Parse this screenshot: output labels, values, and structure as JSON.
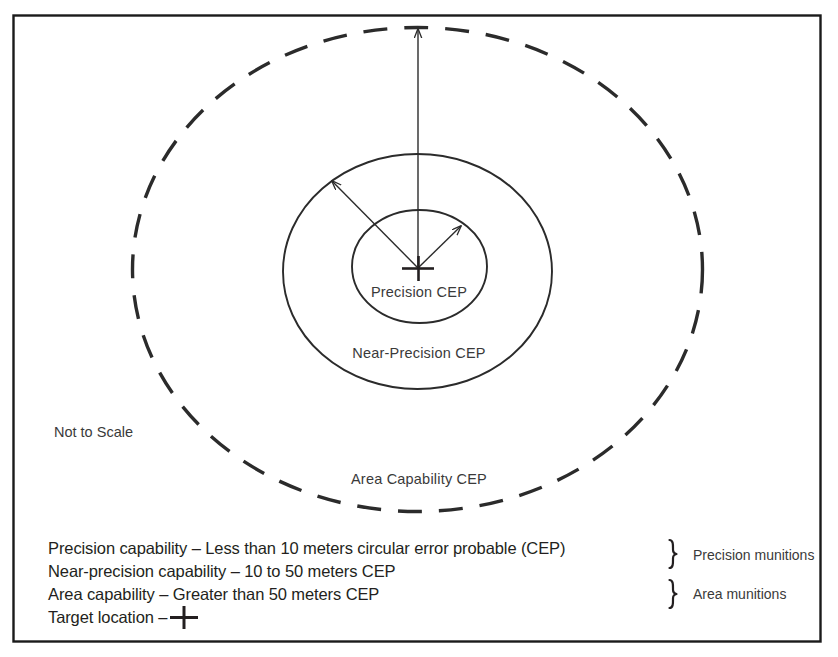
{
  "figure": {
    "note": "Not to Scale",
    "border_color": "#1a1a1a",
    "ring_color": "#2b2b2b",
    "text_color": "#3a3a3a"
  },
  "rings": [
    {
      "id": "precision",
      "label": "Precision CEP",
      "style": "solid",
      "label_x": 419,
      "label_y": 297
    },
    {
      "id": "near-precision",
      "label": "Near-Precision CEP",
      "style": "solid",
      "label_x": 419,
      "label_y": 358
    },
    {
      "id": "area-capability",
      "label": "Area Capability CEP",
      "style": "dashed",
      "label_x": 419,
      "label_y": 484
    }
  ],
  "center_marker": {
    "name": "target-location-cross",
    "x": 418,
    "y": 268
  },
  "arrows": [
    {
      "id": "precision-radius",
      "from": [
        418,
        268
      ],
      "to": [
        461,
        226
      ]
    },
    {
      "id": "near-precision-radius",
      "from": [
        418,
        268
      ],
      "to": [
        332,
        181
      ]
    },
    {
      "id": "area-radius",
      "from": [
        418,
        268
      ],
      "to": [
        418,
        29
      ]
    }
  ],
  "legend": {
    "rows": [
      {
        "id": "precision-capability",
        "text": "Precision capability – Less than 10 meters circular error probable (CEP)"
      },
      {
        "id": "near-precision-capability",
        "text": "Near-precision capability –  10 to 50 meters CEP"
      },
      {
        "id": "area-capability",
        "text": "Area capability –  Greater than 50 meters CEP"
      },
      {
        "id": "target-location",
        "text": "Target location –"
      }
    ],
    "groups": [
      {
        "id": "precision-munitions",
        "label": "Precision munitions"
      },
      {
        "id": "area-munitions",
        "label": "Area munitions"
      }
    ]
  }
}
